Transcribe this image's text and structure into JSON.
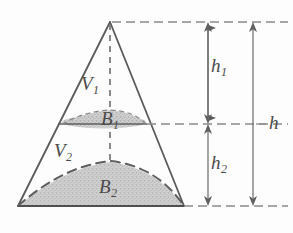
{
  "figure": {
    "type": "geometry-diagram",
    "colors": {
      "stroke": "#5a5a5a",
      "dashed_stroke": "#6d6d6d",
      "shade_fill": "#c9c9c9",
      "shade_stroke": "#7a7a7a",
      "label_color": "#4a4a4a",
      "background": "#fdfdfd"
    },
    "labels": {
      "v1": {
        "base": "V",
        "sub": "1"
      },
      "b1": {
        "base": "B",
        "sub": "1"
      },
      "v2": {
        "base": "V",
        "sub": "2"
      },
      "b2": {
        "base": "B",
        "sub": "2"
      },
      "h1": {
        "base": "h",
        "sub": "1"
      },
      "h2": {
        "base": "h",
        "sub": "2"
      },
      "h": {
        "base": "h",
        "sub": ""
      }
    },
    "geometry": {
      "apex": {
        "x": 110,
        "y": 22
      },
      "base_left": {
        "x": 18,
        "y": 206
      },
      "base_right": {
        "x": 184,
        "y": 206
      },
      "section_level_y": 124,
      "section_left": {
        "x": 58,
        "y": 124
      },
      "section_right": {
        "x": 147,
        "y": 124
      },
      "axis_x": 110,
      "dimension_line_inner_x": 208,
      "dimension_line_outer_x": 253
    }
  }
}
